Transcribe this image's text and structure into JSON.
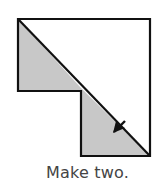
{
  "caption": "Make two.",
  "colors": {
    "outline": "#111111",
    "shaded": "#c8c8c8",
    "background": "#ffffff",
    "caption": "#444444"
  },
  "figure": {
    "icon": "fold-arrow-icon"
  }
}
